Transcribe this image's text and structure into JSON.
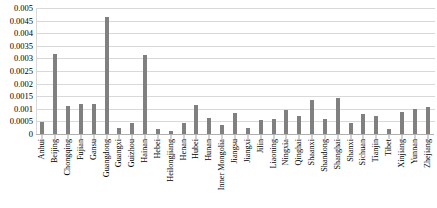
{
  "chart_data": {
    "type": "bar",
    "title": "",
    "subtitle": "",
    "xlabel": "",
    "ylabel": "",
    "ylim": [
      0,
      0.005
    ],
    "grid": true,
    "legend": "none",
    "y_ticks": [
      0,
      0.0005,
      0.001,
      0.0015,
      0.002,
      0.0025,
      0.003,
      0.0035,
      0.004,
      0.0045,
      0.005
    ],
    "y_tick_labels": [
      "0",
      "0.0005",
      "0.001",
      "0.0015",
      "0.002",
      "0.0025",
      "0.003",
      "0.0035",
      "0.004",
      "0.0045",
      "0.005"
    ],
    "bar_color": "#808080",
    "gridline_color": "#D9D9D9",
    "categories": [
      "Anhui",
      "Beijing",
      "Chongqing",
      "Fujian",
      "Gansu",
      "Guangdong",
      "Guangxi",
      "Guizhou",
      "Hainan",
      "Hebei",
      "Heilongjiang",
      "Henan",
      "Hubei",
      "Hunan",
      "Inner Mongolia",
      "Jiangsu",
      "Jiangxi",
      "Jilin",
      "Liaoning",
      "Ningxia",
      "Qinghai",
      "Shaanxi",
      "Shandong",
      "Shanghai",
      "Shanxi",
      "Sichuan",
      "Tianjin",
      "Tibet",
      "Xinjiang",
      "Yunnan",
      "Zhejiang"
    ],
    "values": [
      0.00049,
      0.00318,
      0.00113,
      0.00121,
      0.00119,
      0.00465,
      0.00025,
      0.00043,
      0.00315,
      0.0002,
      0.00013,
      0.00044,
      0.00114,
      0.00062,
      0.00036,
      0.00084,
      0.00022,
      0.00054,
      0.00058,
      0.00095,
      0.00071,
      0.00136,
      0.00058,
      0.00141,
      0.00042,
      0.00081,
      0.00072,
      0.00018,
      0.00087,
      0.00101,
      0.00109
    ]
  }
}
